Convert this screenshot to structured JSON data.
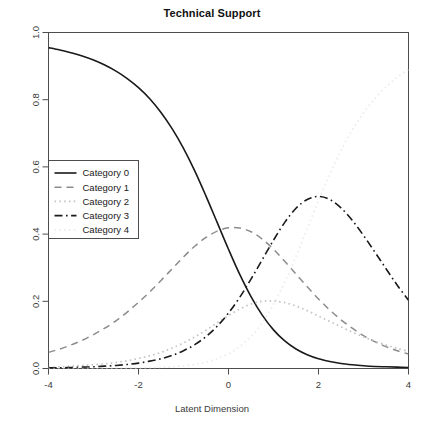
{
  "chart_data": {
    "type": "line",
    "title": "Technical Support",
    "xlabel": "Latent Dimension",
    "ylabel": "",
    "xlim": [
      -4,
      4
    ],
    "ylim": [
      0,
      1
    ],
    "xticks": [
      "-4",
      "-2",
      "0",
      "2",
      "4"
    ],
    "xtick_values": [
      -4,
      -2,
      0,
      2,
      4
    ],
    "yticks": [
      "0.0",
      "0.2",
      "0.4",
      "0.6",
      "0.8",
      "1.0"
    ],
    "ytick_values": [
      0.0,
      0.2,
      0.4,
      0.6,
      0.8,
      1.0
    ],
    "grid": false,
    "legend_position": "left-middle",
    "x": [
      -4,
      -3.75,
      -3.5,
      -3.25,
      -3,
      -2.75,
      -2.5,
      -2.25,
      -2,
      -1.75,
      -1.5,
      -1.25,
      -1,
      -0.75,
      -0.5,
      -0.25,
      0,
      0.25,
      0.5,
      0.75,
      1,
      1.25,
      1.5,
      1.75,
      2,
      2.25,
      2.5,
      2.75,
      3,
      3.25,
      3.5,
      3.75,
      4
    ],
    "series": [
      {
        "name": "Category 0",
        "style": "solid",
        "color": "#1a1a1a",
        "values": [
          0.955,
          0.948,
          0.94,
          0.93,
          0.918,
          0.903,
          0.885,
          0.863,
          0.836,
          0.803,
          0.762,
          0.713,
          0.655,
          0.588,
          0.513,
          0.434,
          0.355,
          0.28,
          0.214,
          0.159,
          0.115,
          0.082,
          0.058,
          0.041,
          0.029,
          0.021,
          0.015,
          0.011,
          0.008,
          0.006,
          0.005,
          0.004,
          0.003
        ]
      },
      {
        "name": "Category 1",
        "style": "dashed",
        "color": "#8c8c8c",
        "values": [
          0.048,
          0.058,
          0.07,
          0.084,
          0.101,
          0.12,
          0.142,
          0.168,
          0.197,
          0.228,
          0.262,
          0.297,
          0.332,
          0.364,
          0.39,
          0.409,
          0.419,
          0.418,
          0.407,
          0.385,
          0.355,
          0.319,
          0.281,
          0.243,
          0.207,
          0.174,
          0.145,
          0.12,
          0.098,
          0.08,
          0.065,
          0.053,
          0.043
        ]
      },
      {
        "name": "Category 2",
        "style": "dotted",
        "color": "#c4c4c4",
        "values": [
          0.004,
          0.005,
          0.007,
          0.009,
          0.011,
          0.014,
          0.018,
          0.023,
          0.03,
          0.038,
          0.048,
          0.061,
          0.076,
          0.094,
          0.114,
          0.136,
          0.158,
          0.177,
          0.192,
          0.2,
          0.201,
          0.196,
          0.186,
          0.172,
          0.156,
          0.14,
          0.124,
          0.108,
          0.094,
          0.081,
          0.07,
          0.06,
          0.051
        ]
      },
      {
        "name": "Category 3",
        "style": "dashdot",
        "color": "#1a1a1a",
        "values": [
          0.002,
          0.002,
          0.003,
          0.004,
          0.005,
          0.007,
          0.009,
          0.012,
          0.016,
          0.022,
          0.029,
          0.039,
          0.053,
          0.071,
          0.095,
          0.126,
          0.165,
          0.212,
          0.266,
          0.324,
          0.382,
          0.435,
          0.477,
          0.503,
          0.512,
          0.503,
          0.478,
          0.441,
          0.396,
          0.347,
          0.297,
          0.248,
          0.203
        ]
      },
      {
        "name": "Category 4",
        "style": "dotted-faint",
        "color": "#ececec",
        "values": [
          0.0,
          0.0,
          0.0,
          0.0,
          0.0,
          0.0,
          0.001,
          0.001,
          0.001,
          0.002,
          0.003,
          0.005,
          0.008,
          0.012,
          0.019,
          0.029,
          0.044,
          0.065,
          0.095,
          0.136,
          0.19,
          0.257,
          0.334,
          0.417,
          0.5,
          0.578,
          0.649,
          0.71,
          0.761,
          0.803,
          0.838,
          0.867,
          0.89
        ]
      }
    ],
    "legend_entries": [
      "Category 0",
      "Category 1",
      "Category 2",
      "Category 3",
      "Category 4"
    ]
  },
  "axis_frame_color": "#4d4d4d"
}
